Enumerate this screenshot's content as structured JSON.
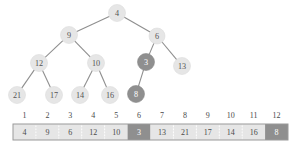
{
  "chart_data": {
    "type": "diagram",
    "title": "",
    "subtitle": "",
    "diagram_kind": "binary-heap-tree-with-array",
    "colors": {
      "node_light_fill": "#e6e6e6",
      "node_dark_fill": "#8f8f8f",
      "node_light_text": "#555555",
      "node_dark_text": "#ffffff",
      "edge": "#8e8e8e",
      "array_frame": "#9a9a9a",
      "array_separator": "#ffffff",
      "background": "#ffffff"
    },
    "tree": {
      "nodes": [
        {
          "id": "n1",
          "label": "4",
          "index": 1,
          "x": 117,
          "y": 13,
          "r": 8.5,
          "highlight": false,
          "depth": 0
        },
        {
          "id": "n2",
          "label": "9",
          "index": 2,
          "x": 69,
          "y": 35,
          "r": 8.5,
          "highlight": false,
          "depth": 1
        },
        {
          "id": "n3",
          "label": "6",
          "index": 3,
          "x": 157,
          "y": 36,
          "r": 8.0,
          "highlight": false,
          "depth": 1
        },
        {
          "id": "n4",
          "label": "12",
          "index": 4,
          "x": 39,
          "y": 63,
          "r": 8.5,
          "highlight": false,
          "depth": 2
        },
        {
          "id": "n5",
          "label": "10",
          "index": 5,
          "x": 96,
          "y": 63,
          "r": 8.5,
          "highlight": false,
          "depth": 2
        },
        {
          "id": "n6",
          "label": "3",
          "index": 6,
          "x": 146,
          "y": 62,
          "r": 8.5,
          "highlight": true,
          "depth": 2
        },
        {
          "id": "n7",
          "label": "13",
          "index": 7,
          "x": 182,
          "y": 66,
          "r": 8.5,
          "highlight": false,
          "depth": 2
        },
        {
          "id": "n8",
          "label": "21",
          "index": 8,
          "x": 17,
          "y": 95,
          "r": 8.5,
          "highlight": false,
          "depth": 3
        },
        {
          "id": "n9",
          "label": "17",
          "index": 9,
          "x": 54,
          "y": 95,
          "r": 8.5,
          "highlight": false,
          "depth": 3
        },
        {
          "id": "n10",
          "label": "14",
          "index": 10,
          "x": 80,
          "y": 95,
          "r": 8.5,
          "highlight": false,
          "depth": 3
        },
        {
          "id": "n11",
          "label": "16",
          "index": 11,
          "x": 110,
          "y": 95,
          "r": 8.5,
          "highlight": false,
          "depth": 3
        },
        {
          "id": "n12",
          "label": "8",
          "index": 12,
          "x": 136,
          "y": 94,
          "r": 8.5,
          "highlight": true,
          "depth": 3
        }
      ],
      "edges": [
        {
          "from": "n1",
          "to": "n2"
        },
        {
          "from": "n1",
          "to": "n3"
        },
        {
          "from": "n2",
          "to": "n4"
        },
        {
          "from": "n2",
          "to": "n5"
        },
        {
          "from": "n3",
          "to": "n6"
        },
        {
          "from": "n3",
          "to": "n7"
        },
        {
          "from": "n4",
          "to": "n8"
        },
        {
          "from": "n4",
          "to": "n9"
        },
        {
          "from": "n5",
          "to": "n10"
        },
        {
          "from": "n5",
          "to": "n11"
        },
        {
          "from": "n6",
          "to": "n12"
        }
      ]
    },
    "array": {
      "x": 13,
      "y": 124,
      "width": 275,
      "height": 16,
      "index_label_y": 115,
      "indices": [
        1,
        2,
        3,
        4,
        5,
        6,
        7,
        8,
        9,
        10,
        11,
        12
      ],
      "values": [
        "4",
        "9",
        "6",
        "12",
        "10",
        "3",
        "13",
        "21",
        "17",
        "14",
        "16",
        "8"
      ],
      "highlighted_indices": [
        6,
        12
      ]
    }
  }
}
